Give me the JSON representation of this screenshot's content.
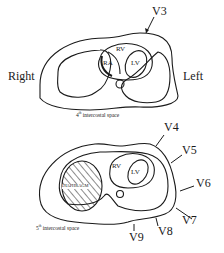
{
  "diagram": {
    "top_section": {
      "caption_ordinal": "4",
      "caption_suffix": "th",
      "caption_text": " intercostal space",
      "side_labels": {
        "right": "Right",
        "left": "Left"
      },
      "chambers": [
        "RV",
        "RA",
        "LV"
      ],
      "leads": [
        {
          "label": "V3"
        }
      ]
    },
    "bottom_section": {
      "caption_ordinal": "5",
      "caption_suffix": "th",
      "caption_text": " intercostal space",
      "chambers": [
        "RV",
        "LV"
      ],
      "organ_label": "DIAPHRAGM",
      "leads": [
        {
          "label": "V4"
        },
        {
          "label": "V5"
        },
        {
          "label": "V6"
        },
        {
          "label": "V7"
        },
        {
          "label": "V8"
        },
        {
          "label": "V9"
        }
      ]
    },
    "colors": {
      "line": "#1a1a1a",
      "background": "#ffffff"
    }
  }
}
